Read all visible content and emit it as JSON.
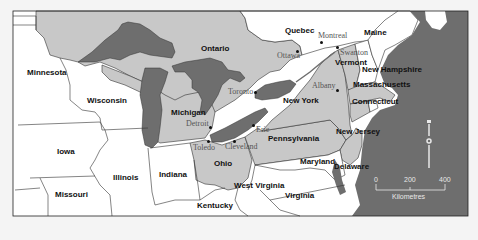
{
  "map": {
    "colors": {
      "background": "#f4f4f4",
      "us_other": "#ffffff",
      "region_highlight": "#c8c8c8",
      "canada_highlight": "#c8c8c8",
      "canada_other": "#ffffff",
      "water": "#6e6e6e",
      "border": "#333333"
    },
    "states": [
      {
        "name": "Minnesota",
        "highlighted": false
      },
      {
        "name": "Wisconsin",
        "highlighted": false
      },
      {
        "name": "Iowa",
        "highlighted": false
      },
      {
        "name": "Missouri",
        "highlighted": false
      },
      {
        "name": "Illinois",
        "highlighted": false
      },
      {
        "name": "Indiana",
        "highlighted": false
      },
      {
        "name": "Kentucky",
        "highlighted": false
      },
      {
        "name": "West Virginia",
        "highlighted": false
      },
      {
        "name": "Virginia",
        "highlighted": false
      },
      {
        "name": "Michigan",
        "highlighted": true
      },
      {
        "name": "Ohio",
        "highlighted": true
      },
      {
        "name": "Pennsylvania",
        "highlighted": true
      },
      {
        "name": "New York",
        "highlighted": true
      },
      {
        "name": "Vermont",
        "highlighted": true
      },
      {
        "name": "New Hampshire",
        "highlighted": false
      },
      {
        "name": "Maine",
        "highlighted": false
      },
      {
        "name": "Massachusetts",
        "highlighted": true
      },
      {
        "name": "Connecticut",
        "highlighted": true
      },
      {
        "name": "New Jersey",
        "highlighted": true
      },
      {
        "name": "Maryland",
        "highlighted": false
      },
      {
        "name": "Delaware",
        "highlighted": false
      }
    ],
    "provinces": [
      {
        "name": "Ontario",
        "highlighted": true
      },
      {
        "name": "Quebec",
        "highlighted": false
      }
    ],
    "cities": [
      {
        "name": "Montreal"
      },
      {
        "name": "Ottawa"
      },
      {
        "name": "Swanton"
      },
      {
        "name": "Toronto"
      },
      {
        "name": "Albany"
      },
      {
        "name": "Detroit"
      },
      {
        "name": "Toledo"
      },
      {
        "name": "Cleveland"
      },
      {
        "name": "Erie"
      }
    ],
    "scale_bar": {
      "ticks": [
        "0",
        "200",
        "400"
      ],
      "unit": "Kilometres"
    },
    "north_arrow": {
      "label": "N"
    }
  }
}
